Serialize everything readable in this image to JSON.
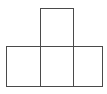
{
  "diagram": {
    "type": "square-arrangement",
    "stroke_color": "#4a4a4a",
    "background": "#ffffff",
    "squares": [
      {
        "id": "top",
        "x": 40,
        "y": 8,
        "w": 34,
        "h": 39
      },
      {
        "id": "bottom-left",
        "x": 6,
        "y": 46,
        "w": 35,
        "h": 41
      },
      {
        "id": "bottom-middle",
        "x": 40,
        "y": 46,
        "w": 34,
        "h": 41
      },
      {
        "id": "bottom-right",
        "x": 73,
        "y": 46,
        "w": 30,
        "h": 41
      }
    ]
  }
}
